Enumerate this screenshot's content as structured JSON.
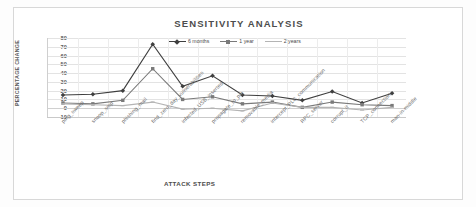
{
  "chart_data": {
    "type": "line",
    "title": "SENSITIVITY ANALYSIS",
    "xlabel": "ATTACK STEPS",
    "ylabel": "PERCENTAGE CHANGE",
    "ylim": [
      -10,
      80
    ],
    "yticks": [
      80,
      70,
      60,
      50,
      40,
      30,
      20,
      10,
      0,
      -10
    ],
    "grid": true,
    "legend_position": "top-center",
    "categories": [
      "ping_sweep",
      "snoop_smp",
      "phishing_mail",
      "find_zero_day_vulnerabilities",
      "infected_USB_inserted",
      "propagate_to_pin",
      "removable_media",
      "intercept_PLC_communication",
      "RPC_server",
      "corrupt_it",
      "TCP_connection",
      "man-in-middle"
    ],
    "series": [
      {
        "name": "6 months",
        "color": "#3f3f3f",
        "marker": "diamond",
        "values": [
          15,
          16,
          20,
          73,
          25,
          37,
          15,
          14,
          9,
          19,
          6,
          17
        ]
      },
      {
        "name": "1 year",
        "color": "#7a7a7a",
        "marker": "square",
        "values": [
          6,
          5,
          9,
          45,
          10,
          13,
          5,
          7,
          1,
          7,
          4,
          3
        ]
      },
      {
        "name": "2 years",
        "color": "#b4b4b4",
        "marker": "dash",
        "values": [
          5,
          4,
          3,
          7,
          -1,
          0,
          -3,
          6,
          1,
          1,
          -2,
          1
        ]
      }
    ]
  }
}
